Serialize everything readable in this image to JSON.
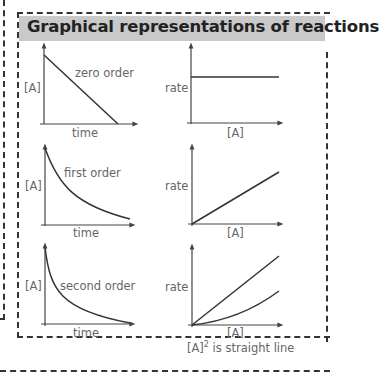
{
  "title": "Graphical representations of reactions",
  "graphs": [
    {
      "id": "zero-order-conc",
      "y_label": "[A]",
      "x_label": "time",
      "curve_label": "zero order",
      "shape": "linear-decrease"
    },
    {
      "id": "zero-order-rate",
      "y_label": "rate",
      "x_label": "[A]",
      "shape": "horizontal-line"
    },
    {
      "id": "first-order-conc",
      "y_label": "[A]",
      "x_label": "time",
      "curve_label": "first order",
      "shape": "exponential-decay"
    },
    {
      "id": "first-order-rate",
      "y_label": "rate",
      "x_label": "[A]",
      "shape": "linear-increase"
    },
    {
      "id": "second-order-conc",
      "y_label": "[A]",
      "x_label": "time",
      "curve_label": "second order",
      "shape": "steep-decay"
    },
    {
      "id": "second-order-rate",
      "y_label": "rate",
      "x_label": "[A]",
      "shape": "line-and-parabola"
    }
  ],
  "note": {
    "prefix": "[A]",
    "superscript": "2",
    "suffix": " is straight line"
  },
  "colors": {
    "header_bg": "#c9c9c9",
    "line": "#333333",
    "label": "#666666"
  }
}
